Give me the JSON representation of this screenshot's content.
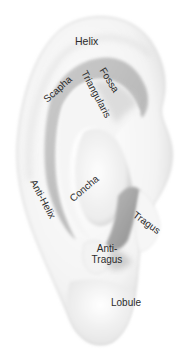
{
  "diagram": {
    "style": "grayscale pencil shading",
    "colors": {
      "background": "#ffffff",
      "skin_light": "#f4f4f4",
      "skin_mid": "#d9d9d9",
      "skin_dark": "#a8a8a8",
      "label_text": "#2b2b2b"
    },
    "labels": {
      "helix": "Helix",
      "scapha": "Scapha",
      "fossa": "Fossa",
      "triangularis": "Triangularis",
      "concha": "Concha",
      "anti_helix": "Anti-Helix",
      "tragus": "Tragus",
      "anti_tragus_line1": "Anti-",
      "anti_tragus_line2": "Tragus",
      "lobule": "Lobule"
    }
  }
}
